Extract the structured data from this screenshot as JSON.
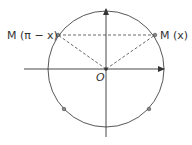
{
  "diagram": {
    "type": "unit-circle",
    "labels": {
      "origin": "O",
      "point_right": "M (x)",
      "point_left": "M (π − x)"
    },
    "colors": {
      "stroke": "#333333",
      "point_fill": "#888888"
    }
  }
}
